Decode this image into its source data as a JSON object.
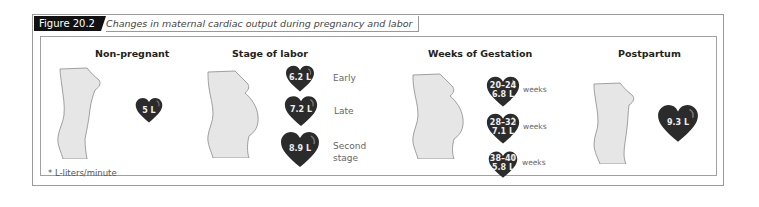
{
  "figure": {
    "number": "Figure 20.2",
    "caption": "Changes in maternal cardiac output during pregnancy and labor"
  },
  "sections": {
    "non_pregnant": {
      "title": "Non-pregnant",
      "hearts": [
        {
          "value": "5 L"
        }
      ]
    },
    "stage_of_labor": {
      "title": "Stage of labor",
      "hearts": [
        {
          "value": "6.2 L",
          "label": "Early"
        },
        {
          "value": "7.2 L",
          "label": "Late"
        },
        {
          "value": "8.9 L",
          "label_line1": "Second",
          "label_line2": "stage"
        }
      ]
    },
    "weeks_of_gestation": {
      "title": "Weeks of Gestation",
      "hearts": [
        {
          "weeks": "20–24",
          "value": "6.8 L",
          "label": "weeks"
        },
        {
          "weeks": "28–32",
          "value": "7.1 L",
          "label": "weeks"
        },
        {
          "weeks": "38–40",
          "value": "5.8 L",
          "label": "weeks"
        }
      ]
    },
    "postpartum": {
      "title": "Postpartum",
      "hearts": [
        {
          "value": "9.3 L"
        }
      ]
    }
  },
  "footnote": "* L-liters/minute",
  "colors": {
    "heart": "#2b2b2b",
    "body_fill": "#e6e6e6",
    "body_stroke": "#8a8a8a",
    "tag_bg": "#111111"
  }
}
